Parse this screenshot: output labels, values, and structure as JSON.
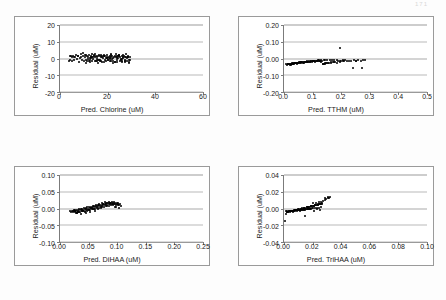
{
  "page": {
    "page_number_mark": "171"
  },
  "charts": [
    {
      "id": "chlorine",
      "type": "scatter",
      "title": "",
      "xlabel": "Pred. Chlorine (uM)",
      "ylabel": "Residual (uM)",
      "xlim": [
        0,
        60
      ],
      "ylim": [
        -20,
        20
      ],
      "xticks": [
        0,
        20,
        40,
        60
      ],
      "xticklabels": [
        "0",
        "20",
        "40",
        "60"
      ],
      "yticks": [
        20,
        10,
        0,
        -10,
        -20
      ],
      "yticklabels": [
        "20",
        "10",
        "0",
        "-10",
        "-20"
      ],
      "grid": true,
      "legend": "none",
      "x": [
        3.6,
        4.0,
        4.3,
        4.6,
        4.9,
        5.2,
        5.6,
        6.0,
        6.4,
        6.8,
        7.2,
        7.6,
        8.0,
        8.4,
        8.8,
        9.2,
        9.6,
        10.0,
        10.3,
        10.6,
        10.9,
        11.2,
        11.5,
        11.8,
        12.1,
        12.4,
        12.7,
        13.0,
        13.3,
        13.6,
        13.9,
        14.2,
        14.5,
        14.8,
        15.1,
        15.4,
        15.7,
        16.0,
        16.3,
        16.6,
        16.9,
        17.2,
        17.5,
        17.8,
        18.1,
        18.4,
        18.7,
        19.0,
        19.3,
        19.6,
        19.9,
        20.2,
        20.5,
        20.8,
        21.1,
        21.4,
        21.7,
        22.0,
        22.3,
        22.6,
        22.9,
        23.2,
        23.5,
        23.8,
        24.1,
        24.4,
        24.7,
        25.0,
        25.3,
        25.6,
        25.9,
        26.2,
        26.5,
        26.8,
        27.1,
        27.4,
        27.7,
        28.0,
        28.3,
        28.6,
        28.9,
        29.2,
        29.5,
        11.0,
        12.5,
        14.0,
        15.5,
        17.0,
        18.5,
        20.0,
        21.5,
        23.0,
        24.5,
        26.0,
        27.5,
        29.0,
        13.2,
        15.8,
        18.3,
        20.9,
        23.4,
        25.9,
        28.4,
        12.0,
        14.6,
        17.1,
        19.7,
        22.2,
        24.8,
        27.3,
        16.2,
        21.0,
        25.8,
        9.5,
        11.9,
        14.3,
        16.7,
        19.1,
        21.5,
        23.9,
        26.3,
        28.7,
        10.8,
        13.4,
        16.0,
        18.6,
        21.2,
        23.8,
        26.4,
        29.0,
        12.8,
        15.2,
        17.6,
        20.0,
        22.4,
        24.8,
        27.2,
        5.8,
        7.4,
        8.9
      ],
      "y": [
        -1.6,
        1.5,
        -0.9,
        1.2,
        -1.4,
        0.8,
        1.6,
        -1.1,
        0.6,
        1.9,
        -0.5,
        1.3,
        -1.8,
        0.4,
        1.1,
        -0.7,
        1.5,
        -1.3,
        0.9,
        2.0,
        -0.6,
        1.4,
        -1.5,
        0.7,
        1.8,
        -1.0,
        0.5,
        1.6,
        -1.7,
        1.0,
        -0.4,
        1.9,
        -1.2,
        0.8,
        1.5,
        -1.6,
        0.6,
        1.3,
        -0.9,
        1.7,
        -1.4,
        0.9,
        1.1,
        -1.8,
        0.5,
        1.6,
        -0.7,
        1.2,
        -1.5,
        0.8,
        1.9,
        -1.1,
        0.6,
        1.4,
        -1.6,
        1.0,
        -0.5,
        1.7,
        -1.3,
        0.9,
        1.2,
        -1.9,
        0.7,
        1.5,
        -1.0,
        0.4,
        1.8,
        -1.4,
        1.1,
        -0.6,
        1.6,
        -1.2,
        0.8,
        1.3,
        -1.7,
        0.9,
        1.0,
        -1.5,
        0.5,
        1.4,
        -1.1,
        0.7,
        -0.8,
        2.3,
        -2.1,
        1.0,
        -0.3,
        2.2,
        -1.9,
        0.2,
        2.5,
        -2.3,
        1.3,
        -0.2,
        2.4,
        -2.0,
        0.3,
        -2.4,
        1.8,
        -0.4,
        2.6,
        -2.2,
        0.6,
        -1.6,
        2.7,
        -1.3,
        0.4,
        -2.5,
        1.5,
        -0.8,
        2.1,
        0.1,
        -0.1,
        3.2,
        -0.2,
        1.2,
        -1.0,
        0.5,
        2.0,
        -1.8,
        0.3,
        1.1,
        -2.6,
        2.8,
        -0.6,
        1.6,
        -1.4,
        0.2,
        2.3,
        -2.7,
        0.9,
        -1.2,
        1.4,
        -0.9,
        0.1,
        1.9,
        -2.2,
        0.8,
        1.7,
        2.4,
        -1.5
      ]
    },
    {
      "id": "tthm",
      "type": "scatter",
      "title": "",
      "xlabel": "Pred. TTHM (uM)",
      "ylabel": "Residual (uM)",
      "xlim": [
        0.0,
        0.5
      ],
      "ylim": [
        -0.2,
        0.2
      ],
      "xticks": [
        0.0,
        0.1,
        0.2,
        0.3,
        0.4,
        0.5
      ],
      "xticklabels": [
        "0.0",
        "0.1",
        "0.2",
        "0.3",
        "0.4",
        "0.5"
      ],
      "yticks": [
        0.2,
        0.1,
        0.0,
        -0.1,
        -0.2
      ],
      "yticklabels": [
        "0.20",
        "0.10",
        "0.00",
        "-0.10",
        "-0.20"
      ],
      "grid": true,
      "legend": "none",
      "x": [
        0.008,
        0.011,
        0.013,
        0.015,
        0.017,
        0.019,
        0.021,
        0.023,
        0.025,
        0.027,
        0.029,
        0.031,
        0.033,
        0.035,
        0.037,
        0.039,
        0.041,
        0.043,
        0.045,
        0.047,
        0.049,
        0.051,
        0.053,
        0.055,
        0.058,
        0.061,
        0.064,
        0.067,
        0.07,
        0.073,
        0.076,
        0.079,
        0.082,
        0.085,
        0.088,
        0.091,
        0.094,
        0.097,
        0.1,
        0.103,
        0.106,
        0.109,
        0.112,
        0.115,
        0.118,
        0.121,
        0.124,
        0.127,
        0.13,
        0.133,
        0.136,
        0.139,
        0.142,
        0.145,
        0.148,
        0.152,
        0.156,
        0.16,
        0.164,
        0.168,
        0.172,
        0.176,
        0.18,
        0.185,
        0.19,
        0.195,
        0.2,
        0.205,
        0.21,
        0.215,
        0.22,
        0.228,
        0.236,
        0.244,
        0.252,
        0.26,
        0.268,
        0.275,
        0.282,
        0.02,
        0.03,
        0.04,
        0.05,
        0.06,
        0.07,
        0.08,
        0.09,
        0.1,
        0.11,
        0.12,
        0.13,
        0.14,
        0.15,
        0.165,
        0.175,
        0.185,
        0.195,
        0.025,
        0.045,
        0.065,
        0.085,
        0.105,
        0.125,
        0.145,
        0.196,
        0.243,
        0.272,
        0.015,
        0.035,
        0.055,
        0.075,
        0.095,
        0.115,
        0.135,
        0.155,
        0.205,
        0.25
      ],
      "y": [
        -0.034,
        -0.036,
        -0.033,
        -0.035,
        -0.032,
        -0.034,
        -0.031,
        -0.033,
        -0.03,
        -0.032,
        -0.029,
        -0.031,
        -0.028,
        -0.03,
        -0.027,
        -0.029,
        -0.026,
        -0.028,
        -0.025,
        -0.027,
        -0.024,
        -0.026,
        -0.023,
        -0.025,
        -0.022,
        -0.024,
        -0.021,
        -0.023,
        -0.02,
        -0.022,
        -0.019,
        -0.021,
        -0.018,
        -0.02,
        -0.017,
        -0.019,
        -0.016,
        -0.018,
        -0.015,
        -0.017,
        -0.014,
        -0.016,
        -0.013,
        -0.015,
        -0.012,
        -0.014,
        -0.011,
        -0.013,
        -0.01,
        -0.012,
        -0.03,
        -0.011,
        -0.028,
        -0.009,
        -0.026,
        -0.01,
        -0.024,
        -0.009,
        -0.022,
        -0.008,
        -0.02,
        -0.01,
        -0.018,
        -0.009,
        -0.017,
        -0.012,
        -0.016,
        -0.01,
        -0.015,
        -0.011,
        -0.014,
        -0.013,
        -0.012,
        -0.011,
        -0.013,
        -0.01,
        -0.012,
        -0.011,
        -0.01,
        -0.038,
        -0.03,
        -0.025,
        -0.028,
        -0.02,
        -0.024,
        -0.016,
        -0.022,
        -0.012,
        -0.019,
        -0.008,
        -0.018,
        -0.03,
        -0.026,
        -0.028,
        -0.022,
        -0.025,
        -0.02,
        -0.04,
        -0.032,
        -0.026,
        -0.021,
        -0.015,
        -0.014,
        -0.033,
        0.06,
        -0.057,
        -0.057,
        -0.035,
        -0.029,
        -0.023,
        -0.018,
        -0.014,
        -0.012,
        -0.032,
        -0.027,
        -0.013,
        -0.012
      ]
    },
    {
      "id": "dihaa",
      "type": "scatter",
      "title": "",
      "xlabel": "Pred. DiHAA (uM)",
      "ylabel": "Residual (uM)",
      "xlim": [
        0.0,
        0.25
      ],
      "ylim": [
        -0.1,
        0.1
      ],
      "xticks": [
        0.0,
        0.05,
        0.1,
        0.15,
        0.2,
        0.25
      ],
      "xticklabels": [
        "0.00",
        "0.05",
        "0.10",
        "0.15",
        "0.20",
        "0.25"
      ],
      "yticks": [
        0.1,
        0.05,
        0.0,
        -0.05,
        -0.1
      ],
      "yticklabels": [
        "0.10",
        "0.05",
        "0.00",
        "-0.05",
        "-0.10"
      ],
      "grid": true,
      "legend": "none",
      "x": [
        0.017,
        0.019,
        0.021,
        0.023,
        0.024,
        0.025,
        0.026,
        0.027,
        0.028,
        0.029,
        0.03,
        0.031,
        0.032,
        0.033,
        0.034,
        0.035,
        0.036,
        0.037,
        0.038,
        0.039,
        0.04,
        0.041,
        0.042,
        0.043,
        0.044,
        0.045,
        0.046,
        0.047,
        0.048,
        0.049,
        0.05,
        0.051,
        0.052,
        0.053,
        0.054,
        0.055,
        0.056,
        0.057,
        0.058,
        0.059,
        0.06,
        0.061,
        0.062,
        0.063,
        0.064,
        0.065,
        0.066,
        0.067,
        0.068,
        0.069,
        0.07,
        0.071,
        0.072,
        0.073,
        0.074,
        0.075,
        0.076,
        0.077,
        0.078,
        0.079,
        0.08,
        0.081,
        0.082,
        0.083,
        0.084,
        0.085,
        0.086,
        0.087,
        0.088,
        0.089,
        0.09,
        0.091,
        0.092,
        0.093,
        0.094,
        0.095,
        0.096,
        0.097,
        0.098,
        0.099,
        0.1,
        0.101,
        0.102,
        0.103,
        0.105,
        0.107,
        0.028,
        0.033,
        0.038,
        0.043,
        0.048,
        0.053,
        0.058,
        0.063,
        0.068,
        0.073,
        0.078,
        0.083,
        0.088,
        0.093,
        0.098,
        0.103,
        0.031,
        0.041,
        0.051,
        0.061,
        0.071,
        0.081,
        0.091,
        0.101,
        0.036,
        0.046,
        0.056,
        0.066,
        0.076,
        0.086,
        0.096,
        0.022,
        0.026,
        0.03
      ],
      "y": [
        -0.007,
        -0.009,
        -0.006,
        -0.01,
        -0.005,
        -0.008,
        -0.011,
        -0.004,
        -0.007,
        -0.012,
        -0.003,
        -0.006,
        -0.009,
        -0.002,
        -0.005,
        -0.01,
        -0.001,
        -0.004,
        -0.008,
        0.0,
        -0.003,
        -0.007,
        0.001,
        -0.002,
        -0.006,
        0.002,
        -0.001,
        -0.005,
        0.003,
        0.0,
        -0.004,
        0.004,
        0.001,
        -0.003,
        0.005,
        0.002,
        -0.002,
        0.006,
        0.003,
        -0.001,
        0.007,
        0.004,
        0.0,
        0.008,
        0.005,
        0.001,
        0.009,
        0.006,
        0.002,
        0.01,
        0.007,
        0.003,
        0.011,
        0.008,
        0.004,
        0.012,
        0.009,
        0.005,
        0.013,
        0.01,
        0.006,
        0.014,
        0.011,
        0.007,
        0.015,
        0.012,
        0.008,
        0.016,
        0.013,
        0.009,
        0.017,
        0.014,
        0.01,
        0.016,
        0.012,
        0.018,
        0.013,
        0.015,
        0.011,
        0.017,
        0.014,
        0.012,
        0.016,
        0.01,
        0.013,
        0.008,
        -0.013,
        -0.011,
        -0.008,
        -0.01,
        -0.006,
        -0.009,
        0.0,
        0.011,
        0.014,
        0.016,
        0.018,
        0.017,
        0.015,
        0.013,
        0.005,
        0.002,
        -0.01,
        -0.007,
        -0.004,
        -0.008,
        0.001,
        0.016,
        0.019,
        0.009,
        -0.015,
        -0.012,
        0.002,
        -0.002,
        0.014,
        0.018,
        0.003,
        -0.008,
        -0.006,
        -0.012
      ]
    },
    {
      "id": "trihaa",
      "type": "scatter",
      "title": "",
      "xlabel": "Pred. TriHAA (uM)",
      "ylabel": "Residual (uM)",
      "xlim": [
        0.0,
        0.1
      ],
      "ylim": [
        -0.04,
        0.04
      ],
      "xticks": [
        0.0,
        0.02,
        0.04,
        0.06,
        0.08,
        0.1
      ],
      "xticklabels": [
        "0.00",
        "0.02",
        "0.04",
        "0.06",
        "0.08",
        "0.10"
      ],
      "yticks": [
        0.04,
        0.02,
        0.0,
        -0.02,
        -0.04
      ],
      "yticklabels": [
        "0.04",
        "0.02",
        "0.00",
        "-0.02",
        "-0.04"
      ],
      "grid": true,
      "legend": "none",
      "x": [
        0.0012,
        0.0018,
        0.0024,
        0.003,
        0.0035,
        0.004,
        0.0045,
        0.005,
        0.0055,
        0.006,
        0.0065,
        0.007,
        0.0075,
        0.008,
        0.0085,
        0.009,
        0.0095,
        0.01,
        0.0105,
        0.011,
        0.0115,
        0.012,
        0.0125,
        0.013,
        0.0135,
        0.014,
        0.0145,
        0.015,
        0.0155,
        0.016,
        0.0165,
        0.017,
        0.0175,
        0.018,
        0.0185,
        0.019,
        0.0195,
        0.02,
        0.0205,
        0.021,
        0.0215,
        0.022,
        0.0225,
        0.023,
        0.0235,
        0.024,
        0.0245,
        0.025,
        0.0255,
        0.026,
        0.0265,
        0.0275,
        0.0285,
        0.0295,
        0.0305,
        0.0315,
        0.032,
        0.0028,
        0.0038,
        0.0048,
        0.0058,
        0.0068,
        0.0078,
        0.0088,
        0.0098,
        0.0108,
        0.0118,
        0.0128,
        0.0138,
        0.0148,
        0.0158,
        0.0168,
        0.0178,
        0.0188,
        0.0198,
        0.0208,
        0.0218,
        0.0228,
        0.0238,
        0.0248,
        0.0258,
        0.0268,
        0.0022,
        0.0042,
        0.0062,
        0.0082,
        0.0102,
        0.0122,
        0.0142,
        0.0162,
        0.0182,
        0.0202,
        0.0222,
        0.0242,
        0.0262,
        0.029,
        0.031,
        0.0008,
        0.015,
        0.021,
        0.023,
        0.025,
        0.006,
        0.011,
        0.017,
        0.019,
        0.0014
      ],
      "y": [
        -0.0035,
        -0.004,
        -0.0032,
        -0.0036,
        -0.003,
        -0.0034,
        -0.0028,
        -0.0032,
        -0.0026,
        -0.003,
        -0.0024,
        -0.0028,
        -0.0022,
        -0.0026,
        -0.002,
        -0.0024,
        -0.0018,
        -0.0022,
        -0.0016,
        -0.002,
        -0.0014,
        -0.0018,
        -0.0012,
        -0.0016,
        -0.001,
        -0.0014,
        -0.0008,
        -0.0012,
        -0.0006,
        -0.001,
        -0.0004,
        -0.0008,
        -0.0002,
        -0.0006,
        0.0,
        -0.0004,
        0.0002,
        0.003,
        0.0004,
        0.0034,
        0.0006,
        0.0038,
        0.0042,
        0.0008,
        0.0046,
        0.005,
        0.001,
        0.0054,
        0.0058,
        0.0012,
        0.0062,
        0.009,
        0.01,
        0.011,
        0.012,
        0.013,
        0.0135,
        -0.0038,
        -0.0034,
        -0.003,
        -0.0026,
        -0.0022,
        -0.0018,
        -0.0014,
        -0.001,
        -0.0006,
        -0.0002,
        0.0002,
        0.0006,
        0.001,
        0.0014,
        0.0018,
        0.0022,
        0.0026,
        0.003,
        0.0034,
        0.0038,
        0.0042,
        0.0046,
        0.005,
        0.0054,
        0.0058,
        -0.0042,
        -0.0036,
        -0.0028,
        -0.002,
        -0.0012,
        -0.0004,
        0.0004,
        0.0012,
        0.002,
        0.006,
        0.007,
        0.008,
        0.0075,
        0.0125,
        0.014,
        -0.015,
        -0.009,
        -0.003,
        0.0,
        -0.0015,
        -0.0045,
        -0.0025,
        0.0015,
        0.0025,
        -0.006
      ]
    }
  ]
}
